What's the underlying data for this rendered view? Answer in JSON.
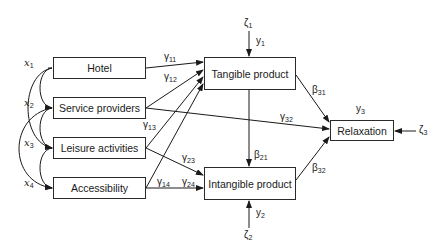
{
  "diagram": {
    "type": "path-model",
    "exogenous": [
      {
        "id": "x1",
        "symbol": "x",
        "index": "1",
        "label": "Hotel"
      },
      {
        "id": "x2",
        "symbol": "x",
        "index": "2",
        "label": "Service providers"
      },
      {
        "id": "x3",
        "symbol": "x",
        "index": "3",
        "label": "Leisure activities"
      },
      {
        "id": "x4",
        "symbol": "x",
        "index": "4",
        "label": "Accessibility"
      }
    ],
    "endogenous": [
      {
        "id": "y1",
        "symbol": "y",
        "index": "1",
        "label": "Tangible product",
        "error": {
          "symbol": "ζ",
          "index": "1"
        }
      },
      {
        "id": "y2",
        "symbol": "y",
        "index": "2",
        "label": "Intangible product",
        "error": {
          "symbol": "ζ",
          "index": "2"
        }
      },
      {
        "id": "y3",
        "symbol": "y",
        "index": "3",
        "label": "Relaxation",
        "error": {
          "symbol": "ζ",
          "index": "3"
        }
      }
    ],
    "paths": [
      {
        "from": "x1",
        "to": "y1",
        "symbol": "γ",
        "index": "11"
      },
      {
        "from": "x2",
        "to": "y1",
        "symbol": "γ",
        "index": "12"
      },
      {
        "from": "x3",
        "to": "y1",
        "symbol": "γ",
        "index": "13"
      },
      {
        "from": "x4",
        "to": "y1",
        "symbol": "γ",
        "index": "14"
      },
      {
        "from": "x3",
        "to": "y2",
        "symbol": "γ",
        "index": "23"
      },
      {
        "from": "x4",
        "to": "y2",
        "symbol": "γ",
        "index": "24"
      },
      {
        "from": "x2",
        "to": "y3",
        "symbol": "γ",
        "index": "32"
      },
      {
        "from": "y1",
        "to": "y2",
        "symbol": "β",
        "index": "21"
      },
      {
        "from": "y1",
        "to": "y3",
        "symbol": "β",
        "index": "31"
      },
      {
        "from": "y2",
        "to": "y3",
        "symbol": "β",
        "index": "32"
      }
    ],
    "correlations": [
      "x1-x2",
      "x2-x3",
      "x3-x4",
      "x1-x3",
      "x2-x4"
    ]
  }
}
